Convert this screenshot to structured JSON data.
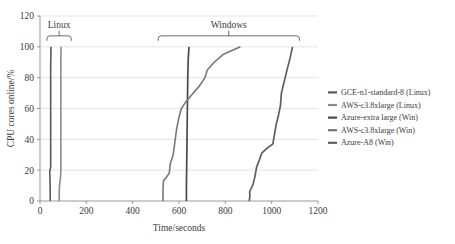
{
  "chart_data": {
    "type": "line",
    "title": "",
    "xlabel": "Time/seconds",
    "ylabel": "CPU cores online/%",
    "xlim": [
      0,
      1200
    ],
    "ylim": [
      0,
      120
    ],
    "xticks": [
      "0",
      "200",
      "400",
      "600",
      "800",
      "1000",
      "1200"
    ],
    "yticks": [
      "0",
      "20",
      "40",
      "60",
      "80",
      "100",
      "120"
    ],
    "xtick_values": [
      0,
      200,
      400,
      600,
      800,
      1000,
      1200
    ],
    "ytick_values": [
      0,
      20,
      40,
      60,
      80,
      100,
      120
    ],
    "grid": "horizontal",
    "legend_position": "right",
    "annotations": [
      {
        "label": "Linux",
        "x_start": 30,
        "x_end": 135,
        "y": 100
      },
      {
        "label": "Windows",
        "x_start": 510,
        "x_end": 1120,
        "y": 100
      }
    ],
    "series": [
      {
        "name": "GCE-n1-standard-8 (Linux)",
        "color": "#595959",
        "width": 1.6,
        "points": [
          [
            44,
            0
          ],
          [
            44,
            8
          ],
          [
            43,
            14
          ],
          [
            42,
            19
          ],
          [
            46,
            22
          ],
          [
            46,
            30
          ],
          [
            46,
            45
          ],
          [
            46,
            60
          ],
          [
            46,
            75
          ],
          [
            46,
            88
          ],
          [
            47,
            95
          ],
          [
            47,
            100
          ]
        ]
      },
      {
        "name": "AWS-c3.8xlarge (Linux)",
        "color": "#8c8c8c",
        "width": 1.6,
        "points": [
          [
            83,
            0
          ],
          [
            83,
            6
          ],
          [
            84,
            10
          ],
          [
            88,
            14
          ],
          [
            90,
            20
          ],
          [
            90,
            35
          ],
          [
            90,
            50
          ],
          [
            90,
            65
          ],
          [
            90,
            80
          ],
          [
            90,
            92
          ],
          [
            91,
            100
          ]
        ]
      },
      {
        "name": "Azure-extra large (Win)",
        "color": "#4a4a4a",
        "width": 1.7,
        "points": [
          [
            632,
            0
          ],
          [
            632,
            10
          ],
          [
            633,
            20
          ],
          [
            634,
            32
          ],
          [
            635,
            45
          ],
          [
            636,
            58
          ],
          [
            637,
            70
          ],
          [
            638,
            82
          ],
          [
            640,
            92
          ],
          [
            643,
            100
          ]
        ]
      },
      {
        "name": "AWS-c3.8xlarge (Win)",
        "color": "#777777",
        "width": 1.6,
        "points": [
          [
            531,
            0
          ],
          [
            531,
            8
          ],
          [
            533,
            13
          ],
          [
            558,
            18
          ],
          [
            562,
            24
          ],
          [
            575,
            30
          ],
          [
            582,
            38
          ],
          [
            590,
            47
          ],
          [
            598,
            53
          ],
          [
            610,
            60
          ],
          [
            628,
            64
          ],
          [
            662,
            70
          ],
          [
            690,
            75
          ],
          [
            712,
            80
          ],
          [
            722,
            85
          ],
          [
            752,
            90
          ],
          [
            790,
            95
          ],
          [
            865,
            100
          ]
        ]
      },
      {
        "name": "Azure-A8 (Win)",
        "color": "#5f5f5f",
        "width": 1.7,
        "points": [
          [
            903,
            0
          ],
          [
            906,
            3
          ],
          [
            905,
            6
          ],
          [
            920,
            11
          ],
          [
            928,
            16
          ],
          [
            935,
            22
          ],
          [
            948,
            27
          ],
          [
            957,
            31
          ],
          [
            978,
            34
          ],
          [
            1005,
            37
          ],
          [
            1012,
            43
          ],
          [
            1020,
            50
          ],
          [
            1030,
            56
          ],
          [
            1038,
            62
          ],
          [
            1042,
            70
          ],
          [
            1055,
            78
          ],
          [
            1068,
            86
          ],
          [
            1080,
            93
          ],
          [
            1090,
            100
          ]
        ]
      }
    ]
  },
  "legend": {
    "items": [
      {
        "label": "GCE-n1-standard-8 (Linux)",
        "color": "#595959"
      },
      {
        "label": "AWS-c3.8xlarge (Linux)",
        "color": "#8c8c8c"
      },
      {
        "label": "Azure-extra large (Win)",
        "color": "#4a4a4a"
      },
      {
        "label": "AWS-c3.8xlarge (Win)",
        "color": "#777777"
      },
      {
        "label": "Azure-A8 (Win)",
        "color": "#5f5f5f"
      }
    ]
  }
}
